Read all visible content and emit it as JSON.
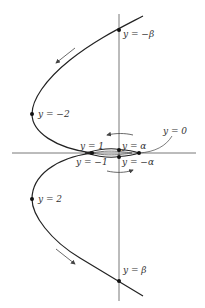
{
  "diagram": {
    "colors": {
      "curve": "#222222",
      "axis": "#555555",
      "arrow": "#444444",
      "text": "#333333"
    },
    "axes": {
      "vertical": {
        "x": 119,
        "y1": 14,
        "y2": 301
      },
      "horizontal": {
        "y": 153,
        "x1": 12,
        "x2": 196
      }
    },
    "labels": {
      "neg_beta": "y = −β",
      "neg_two": "y = −2",
      "one": "y = 1",
      "alpha": "y = α",
      "zero": "y = 0",
      "neg_one": "y = −1",
      "neg_alpha": "y = −α",
      "two": "y = 2",
      "beta": "y = β"
    },
    "points": [
      {
        "name": "neg-beta",
        "x": 119,
        "y": 30
      },
      {
        "name": "neg-two",
        "x": 32,
        "y": 114
      },
      {
        "name": "one",
        "x": 92,
        "y": 153
      },
      {
        "name": "alpha",
        "x": 119,
        "y": 150
      },
      {
        "name": "neg-alpha",
        "x": 119,
        "y": 157
      },
      {
        "name": "zero",
        "x": 139,
        "y": 153
      },
      {
        "name": "two",
        "x": 32,
        "y": 199
      },
      {
        "name": "beta",
        "x": 119,
        "y": 281
      }
    ]
  }
}
